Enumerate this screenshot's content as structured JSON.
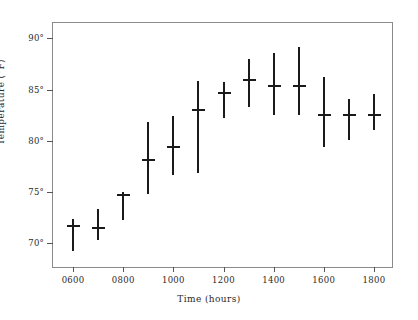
{
  "chart_data": {
    "type": "scatter",
    "title": "",
    "xlabel": "Time (hours)",
    "ylabel": "Temperature (°F)",
    "x": [
      "0600",
      "0700",
      "0800",
      "0900",
      "1000",
      "1100",
      "1200",
      "1300",
      "1400",
      "1500",
      "1600",
      "1700",
      "1800"
    ],
    "xlim": [
      520,
      1880
    ],
    "ylim": [
      67.5,
      91.5
    ],
    "xticks": [
      "0600",
      "0800",
      "1000",
      "1200",
      "1400",
      "1600",
      "1800"
    ],
    "xtick_values": [
      600,
      800,
      1000,
      1200,
      1400,
      1600,
      1800
    ],
    "yticks": [
      "70°",
      "75°",
      "80°",
      "85°",
      "90°"
    ],
    "ytick_values": [
      70,
      75,
      80,
      85,
      90
    ],
    "grid": false,
    "legend": null,
    "error_bars": "vertical range with center cap",
    "values": [
      71.7,
      71.5,
      74.7,
      78.1,
      79.4,
      83.0,
      84.7,
      85.9,
      85.4,
      85.4,
      82.5,
      82.5,
      82.5
    ],
    "y_low": [
      69.3,
      70.3,
      72.3,
      74.8,
      76.7,
      76.9,
      82.2,
      83.3,
      82.5,
      82.5,
      79.4,
      80.1,
      81.1
    ],
    "y_high": [
      72.4,
      73.4,
      75.0,
      81.8,
      82.4,
      85.8,
      85.7,
      88.0,
      88.6,
      89.2,
      86.2,
      84.1,
      84.6
    ]
  },
  "axes": {
    "x_title": "Time (hours)",
    "y_title": "Temperature (°F)"
  },
  "style": {
    "marker_color": "#1a1a1a",
    "frame_color": "#8a8a8a",
    "background": "#ffffff"
  }
}
